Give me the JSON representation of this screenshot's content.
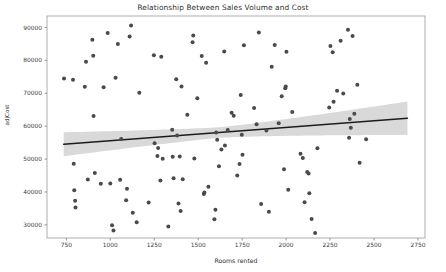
{
  "chart_data": {
    "type": "scatter",
    "title": "Relationship Between Sales Volume and Cost",
    "xlabel": "Rooms rented",
    "ylabel": "adjCost",
    "xlim": [
      640,
      2790
    ],
    "ylim": [
      26000,
      93500
    ],
    "xticks": [
      750,
      1000,
      1250,
      1500,
      1750,
      2000,
      2250,
      2500,
      2750
    ],
    "xtick_labels": [
      "750",
      "1000",
      "1250",
      "1500",
      "1750",
      "2000",
      "2250",
      "2500",
      "2750"
    ],
    "yticks": [
      30000,
      40000,
      50000,
      60000,
      70000,
      80000,
      90000
    ],
    "ytick_labels": [
      "30000",
      "40000",
      "50000",
      "60000",
      "70000",
      "80000",
      "90000"
    ],
    "grid": false,
    "legend": null,
    "marker_color": "#4a4a4a",
    "marker_size": 2.0,
    "line_color": "#1c1c1c",
    "band_color": "#d9d9d9",
    "regression": {
      "x_start": 735,
      "y_start": 54500,
      "x_end": 2690,
      "y_end": 62400,
      "band_halfwidth_start": 4200,
      "band_halfwidth_mid": 1600,
      "band_halfwidth_end": 5100,
      "band_center_x": 1620
    },
    "points": [
      [
        737,
        74500
      ],
      [
        788,
        74100
      ],
      [
        792,
        48600
      ],
      [
        795,
        40500
      ],
      [
        800,
        37300
      ],
      [
        802,
        35300
      ],
      [
        855,
        72000
      ],
      [
        862,
        79600
      ],
      [
        872,
        43800
      ],
      [
        898,
        86300
      ],
      [
        903,
        81400
      ],
      [
        905,
        63100
      ],
      [
        912,
        45800
      ],
      [
        946,
        42500
      ],
      [
        962,
        71800
      ],
      [
        985,
        88300
      ],
      [
        1000,
        42600
      ],
      [
        1010,
        29900
      ],
      [
        1018,
        28300
      ],
      [
        1030,
        74700
      ],
      [
        1043,
        85000
      ],
      [
        1056,
        43700
      ],
      [
        1062,
        56100
      ],
      [
        1090,
        37500
      ],
      [
        1095,
        41000
      ],
      [
        1110,
        87300
      ],
      [
        1118,
        90600
      ],
      [
        1128,
        33700
      ],
      [
        1150,
        30800
      ],
      [
        1165,
        70200
      ],
      [
        1218,
        36800
      ],
      [
        1248,
        81600
      ],
      [
        1252,
        54800
      ],
      [
        1268,
        50900
      ],
      [
        1272,
        53400
      ],
      [
        1285,
        43500
      ],
      [
        1290,
        81100
      ],
      [
        1298,
        50100
      ],
      [
        1330,
        29500
      ],
      [
        1352,
        58900
      ],
      [
        1355,
        50700
      ],
      [
        1360,
        44200
      ],
      [
        1375,
        74300
      ],
      [
        1380,
        57200
      ],
      [
        1388,
        36500
      ],
      [
        1395,
        50800
      ],
      [
        1400,
        34200
      ],
      [
        1405,
        72100
      ],
      [
        1412,
        43900
      ],
      [
        1438,
        63500
      ],
      [
        1468,
        85500
      ],
      [
        1472,
        87600
      ],
      [
        1478,
        50200
      ],
      [
        1495,
        68500
      ],
      [
        1520,
        81300
      ],
      [
        1532,
        39400
      ],
      [
        1535,
        39800
      ],
      [
        1545,
        79300
      ],
      [
        1558,
        41600
      ],
      [
        1592,
        31700
      ],
      [
        1598,
        34600
      ],
      [
        1602,
        58100
      ],
      [
        1608,
        55900
      ],
      [
        1618,
        47800
      ],
      [
        1632,
        52900
      ],
      [
        1648,
        82700
      ],
      [
        1652,
        54100
      ],
      [
        1668,
        58800
      ],
      [
        1690,
        64100
      ],
      [
        1702,
        63200
      ],
      [
        1722,
        45000
      ],
      [
        1735,
        48500
      ],
      [
        1742,
        69500
      ],
      [
        1748,
        57400
      ],
      [
        1752,
        51300
      ],
      [
        1760,
        84600
      ],
      [
        1818,
        65500
      ],
      [
        1832,
        60600
      ],
      [
        1845,
        88500
      ],
      [
        1858,
        36300
      ],
      [
        1888,
        58700
      ],
      [
        1902,
        34000
      ],
      [
        1918,
        78100
      ],
      [
        1935,
        84700
      ],
      [
        1958,
        60900
      ],
      [
        1975,
        69100
      ],
      [
        1988,
        46900
      ],
      [
        1995,
        71500
      ],
      [
        1998,
        72100
      ],
      [
        2002,
        82600
      ],
      [
        2012,
        40700
      ],
      [
        2035,
        64300
      ],
      [
        2082,
        51600
      ],
      [
        2095,
        50300
      ],
      [
        2105,
        36900
      ],
      [
        2120,
        46100
      ],
      [
        2128,
        45600
      ],
      [
        2132,
        39600
      ],
      [
        2145,
        31800
      ],
      [
        2165,
        27500
      ],
      [
        2178,
        53300
      ],
      [
        2245,
        65700
      ],
      [
        2252,
        84400
      ],
      [
        2265,
        82500
      ],
      [
        2270,
        67400
      ],
      [
        2290,
        70800
      ],
      [
        2310,
        86000
      ],
      [
        2325,
        69900
      ],
      [
        2352,
        89300
      ],
      [
        2358,
        56500
      ],
      [
        2362,
        62200
      ],
      [
        2368,
        59500
      ],
      [
        2378,
        87400
      ],
      [
        2388,
        63800
      ],
      [
        2405,
        72600
      ],
      [
        2418,
        48900
      ],
      [
        2455,
        56000
      ]
    ]
  }
}
